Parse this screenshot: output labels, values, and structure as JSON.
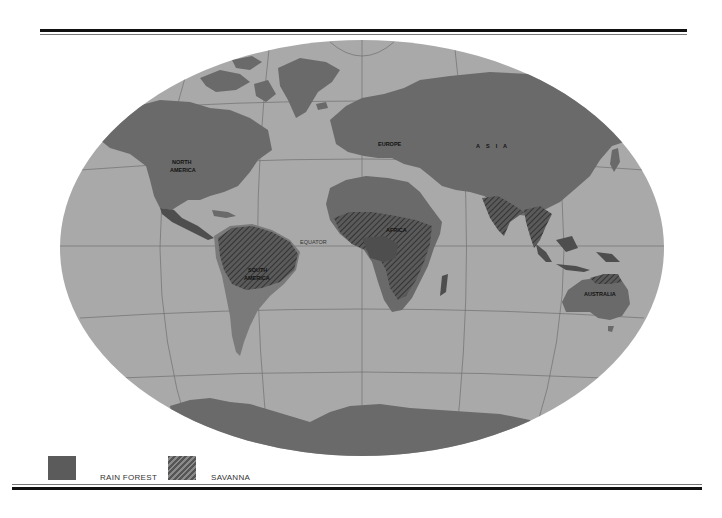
{
  "map": {
    "projection": "elliptical world map",
    "colors": {
      "ocean": "#a9a9a9",
      "land": "#6a6a6a",
      "rain_forest": "#4e4e4e",
      "savanna_hatch": "#3c3c3c",
      "gridlines": "#707070",
      "background": "#ffffff"
    },
    "labels": {
      "north_america": [
        "NORTH",
        "AMERICA"
      ],
      "south_america": [
        "SOUTH",
        "AMERICA"
      ],
      "europe": "EUROPE",
      "asia": "A    S    I    A",
      "africa": "AFRICA",
      "australia": "AUSTRALIA",
      "equator": "EQUATOR"
    }
  },
  "legend": {
    "items": [
      {
        "label": "RAIN FOREST",
        "pattern": "solid"
      },
      {
        "label": "SAVANNA",
        "pattern": "hatched"
      }
    ]
  }
}
